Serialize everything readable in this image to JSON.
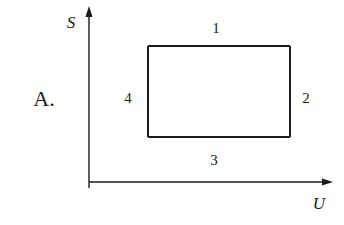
{
  "option_label": "A.",
  "axes": {
    "y_label": "S",
    "x_label": "U"
  },
  "cycle": {
    "shape": "rectangle",
    "edges": [
      {
        "id": "1",
        "side": "top",
        "label": "1"
      },
      {
        "id": "2",
        "side": "right",
        "label": "2"
      },
      {
        "id": "3",
        "side": "bottom",
        "label": "3"
      },
      {
        "id": "4",
        "side": "left",
        "label": "4"
      }
    ]
  },
  "colors": {
    "line": "#1a1a1a",
    "background": "#ffffff"
  }
}
